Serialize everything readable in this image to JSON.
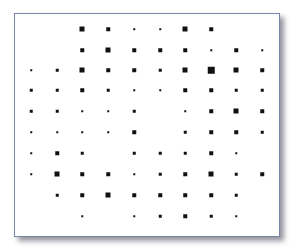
{
  "chart_data": {
    "type": "heatmap",
    "title": "",
    "xlabel": "",
    "ylabel": "",
    "grid": false,
    "legend": "none",
    "style": "square-size dot matrix (Hinton-style)",
    "rows": 10,
    "cols": 10,
    "size_scale": {
      "0": "none",
      "1": "tiny",
      "2": "small",
      "3": "medium",
      "4": "large",
      "5": "xlarge"
    },
    "size_px": [
      0,
      1.5,
      2.5,
      3.5,
      5,
      6.5
    ],
    "col_x": [
      31,
      57,
      82,
      108,
      134,
      160,
      185,
      211,
      236,
      262
    ],
    "row_y": [
      29,
      50,
      70,
      90,
      111,
      132,
      153,
      174,
      195,
      216
    ],
    "values": [
      [
        0,
        0,
        4,
        3,
        1,
        1,
        4,
        3,
        0,
        0
      ],
      [
        0,
        0,
        3,
        4,
        3,
        3,
        3,
        1,
        3,
        1
      ],
      [
        1,
        2,
        4,
        3,
        3,
        2,
        4,
        5,
        4,
        3
      ],
      [
        2,
        2,
        3,
        2,
        1,
        1,
        3,
        3,
        2,
        2
      ],
      [
        2,
        2,
        1,
        1,
        2,
        0,
        1,
        3,
        4,
        3
      ],
      [
        1,
        1,
        1,
        1,
        3,
        0,
        2,
        3,
        3,
        2
      ],
      [
        1,
        3,
        2,
        0,
        2,
        2,
        2,
        3,
        1,
        0
      ],
      [
        1,
        4,
        3,
        3,
        1,
        2,
        3,
        4,
        2,
        3
      ],
      [
        0,
        2,
        3,
        4,
        3,
        3,
        3,
        3,
        2,
        0
      ],
      [
        0,
        0,
        1,
        0,
        1,
        2,
        3,
        2,
        1,
        0
      ]
    ],
    "colors": {
      "dot": "#111111",
      "frame_border": "#7a86a8",
      "background": "#ffffff"
    }
  }
}
